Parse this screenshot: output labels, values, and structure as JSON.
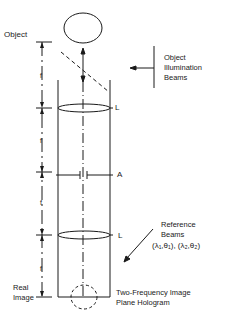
{
  "labels": {
    "object": "Object",
    "illumination_line1": "Object",
    "illumination_line2": "Illumination",
    "illumination_line3": "Beams",
    "lens_top": "L",
    "aperture": "A",
    "lens_bottom": "L",
    "reference_line1": "Reference",
    "reference_line2": "Beams",
    "reference_params": "(λ₁,θ₁),  (λ₂,θ₂)",
    "real_image_line1": "Real",
    "real_image_line2": "Image",
    "hologram_line1": "Two-Frequency Image",
    "hologram_line2": "Plane Hologram",
    "focal_1": "f",
    "focal_2": "f",
    "focal_3": "f",
    "focal_4": "f"
  },
  "colors": {
    "stroke": "#1a1a1a",
    "background": "#ffffff"
  }
}
